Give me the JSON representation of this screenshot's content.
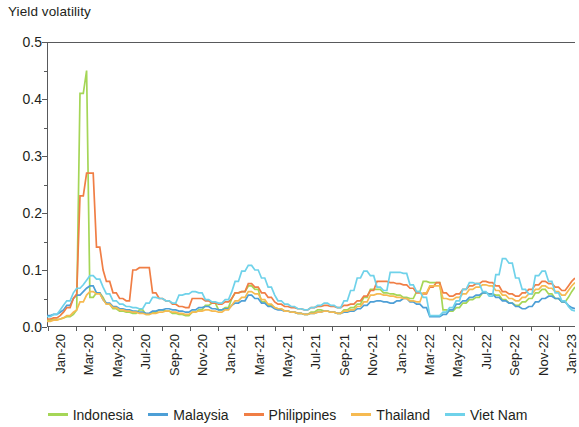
{
  "chart_data": {
    "type": "line",
    "title": "Yield volatility",
    "xlabel": "",
    "ylabel": "",
    "ylim": [
      0.0,
      0.5
    ],
    "ytick_labels": [
      "0.0",
      "0.1",
      "0.2",
      "0.3",
      "0.4",
      "0.5"
    ],
    "ytick_values": [
      0.0,
      0.1,
      0.2,
      0.3,
      0.4,
      0.5
    ],
    "yminor_step": 0.05,
    "grid": false,
    "legend_position": "bottom",
    "x_start": "Jan-20",
    "x_end": "Jan-23",
    "x_tick_labels": [
      "Jan-20",
      "Mar-20",
      "May-20",
      "Jul-20",
      "Sep-20",
      "Nov-20",
      "Jan-21",
      "Mar-21",
      "May-21",
      "Jul-21",
      "Sep-21",
      "Nov-21",
      "Jan-22",
      "Mar-22",
      "May-22",
      "Jul-22",
      "Sep-22",
      "Nov-22",
      "Jan-23"
    ],
    "x": [
      "2020-01-01",
      "2020-01-08",
      "2020-01-15",
      "2020-01-22",
      "2020-01-29",
      "2020-02-05",
      "2020-02-12",
      "2020-02-19",
      "2020-02-26",
      "2020-03-04",
      "2020-03-11",
      "2020-03-18",
      "2020-03-25",
      "2020-04-01",
      "2020-04-08",
      "2020-04-15",
      "2020-04-22",
      "2020-04-29",
      "2020-05-06",
      "2020-05-13",
      "2020-05-20",
      "2020-05-27",
      "2020-06-03",
      "2020-06-10",
      "2020-06-17",
      "2020-06-24",
      "2020-07-01",
      "2020-07-08",
      "2020-07-15",
      "2020-07-22",
      "2020-07-29",
      "2020-08-05",
      "2020-08-12",
      "2020-08-19",
      "2020-08-26",
      "2020-09-02",
      "2020-09-09",
      "2020-09-16",
      "2020-09-23",
      "2020-09-30",
      "2020-10-07",
      "2020-10-14",
      "2020-10-21",
      "2020-10-28",
      "2020-11-04",
      "2020-11-11",
      "2020-11-18",
      "2020-11-25",
      "2020-12-02",
      "2020-12-09",
      "2020-12-16",
      "2020-12-23",
      "2020-12-30",
      "2021-01-06",
      "2021-01-13",
      "2021-01-20",
      "2021-01-27",
      "2021-02-03",
      "2021-02-10",
      "2021-02-17",
      "2021-02-24",
      "2021-03-03",
      "2021-03-10",
      "2021-03-17",
      "2021-03-24",
      "2021-03-31",
      "2021-04-07",
      "2021-04-14",
      "2021-04-21",
      "2021-04-28",
      "2021-05-05",
      "2021-05-12",
      "2021-05-19",
      "2021-05-26",
      "2021-06-02",
      "2021-06-09",
      "2021-06-16",
      "2021-06-23",
      "2021-06-30",
      "2021-07-07",
      "2021-07-14",
      "2021-07-21",
      "2021-07-28",
      "2021-08-04",
      "2021-08-11",
      "2021-08-18",
      "2021-08-25",
      "2021-09-01",
      "2021-09-08",
      "2021-09-15",
      "2021-09-22",
      "2021-09-29",
      "2021-10-06",
      "2021-10-13",
      "2021-10-20",
      "2021-10-27",
      "2021-11-03",
      "2021-11-10",
      "2021-11-17",
      "2021-11-24",
      "2021-12-01",
      "2021-12-08",
      "2021-12-15",
      "2021-12-22",
      "2021-12-29",
      "2022-01-05",
      "2022-01-12",
      "2022-01-19",
      "2022-01-26",
      "2022-02-02",
      "2022-02-09",
      "2022-02-16",
      "2022-02-23",
      "2022-03-02",
      "2022-03-09",
      "2022-03-16",
      "2022-03-23",
      "2022-03-30",
      "2022-04-06",
      "2022-04-13",
      "2022-04-20",
      "2022-04-27",
      "2022-05-04",
      "2022-05-11",
      "2022-05-18",
      "2022-05-25",
      "2022-06-01",
      "2022-06-08",
      "2022-06-15",
      "2022-06-22",
      "2022-06-29",
      "2022-07-06",
      "2022-07-13",
      "2022-07-20",
      "2022-07-27",
      "2022-08-03",
      "2022-08-10",
      "2022-08-17",
      "2022-08-24",
      "2022-08-31",
      "2022-09-07",
      "2022-09-14",
      "2022-09-21",
      "2022-09-28",
      "2022-10-05",
      "2022-10-12",
      "2022-10-19",
      "2022-10-26",
      "2022-11-02",
      "2022-11-09",
      "2022-11-16",
      "2022-11-23",
      "2022-11-30",
      "2022-12-07",
      "2022-12-14",
      "2022-12-21",
      "2022-12-28",
      "2023-01-04",
      "2023-01-11",
      "2023-01-18",
      "2023-01-25"
    ],
    "series": [
      {
        "name": "Indonesia",
        "color": "#a5d657",
        "values": [
          0.012,
          0.012,
          0.013,
          0.013,
          0.014,
          0.016,
          0.018,
          0.018,
          0.022,
          0.03,
          0.41,
          0.41,
          0.45,
          0.052,
          0.052,
          0.06,
          0.06,
          0.052,
          0.04,
          0.04,
          0.032,
          0.032,
          0.028,
          0.028,
          0.026,
          0.026,
          0.024,
          0.024,
          0.03,
          0.03,
          0.022,
          0.022,
          0.026,
          0.026,
          0.03,
          0.03,
          0.028,
          0.028,
          0.024,
          0.024,
          0.022,
          0.022,
          0.02,
          0.02,
          0.026,
          0.026,
          0.03,
          0.03,
          0.038,
          0.038,
          0.042,
          0.042,
          0.03,
          0.03,
          0.034,
          0.034,
          0.05,
          0.06,
          0.06,
          0.062,
          0.062,
          0.072,
          0.072,
          0.066,
          0.066,
          0.044,
          0.044,
          0.038,
          0.038,
          0.034,
          0.032,
          0.032,
          0.028,
          0.028,
          0.026,
          0.026,
          0.024,
          0.024,
          0.022,
          0.022,
          0.026,
          0.026,
          0.03,
          0.03,
          0.028,
          0.028,
          0.026,
          0.026,
          0.024,
          0.024,
          0.03,
          0.03,
          0.034,
          0.034,
          0.04,
          0.04,
          0.052,
          0.052,
          0.066,
          0.066,
          0.066,
          0.066,
          0.06,
          0.06,
          0.058,
          0.058,
          0.056,
          0.056,
          0.052,
          0.052,
          0.05,
          0.05,
          0.062,
          0.062,
          0.08,
          0.08,
          0.078,
          0.078,
          0.078,
          0.078,
          0.03,
          0.03,
          0.028,
          0.028,
          0.034,
          0.034,
          0.042,
          0.042,
          0.048,
          0.048,
          0.052,
          0.052,
          0.06,
          0.06,
          0.058,
          0.058,
          0.056,
          0.056,
          0.048,
          0.048,
          0.042,
          0.042,
          0.038,
          0.038,
          0.044,
          0.044,
          0.05,
          0.05,
          0.06,
          0.06,
          0.066,
          0.066,
          0.058,
          0.058,
          0.05,
          0.05,
          0.044,
          0.044,
          0.052,
          0.062,
          0.07
        ]
      },
      {
        "name": "Malaysia",
        "color": "#4d9fd6",
        "values": [
          0.02,
          0.02,
          0.022,
          0.022,
          0.026,
          0.03,
          0.038,
          0.038,
          0.05,
          0.056,
          0.056,
          0.062,
          0.068,
          0.072,
          0.072,
          0.06,
          0.06,
          0.048,
          0.042,
          0.042,
          0.036,
          0.036,
          0.032,
          0.032,
          0.03,
          0.03,
          0.028,
          0.028,
          0.026,
          0.026,
          0.024,
          0.024,
          0.028,
          0.028,
          0.03,
          0.03,
          0.032,
          0.032,
          0.03,
          0.03,
          0.028,
          0.028,
          0.026,
          0.026,
          0.03,
          0.03,
          0.034,
          0.034,
          0.036,
          0.036,
          0.032,
          0.032,
          0.03,
          0.03,
          0.032,
          0.032,
          0.038,
          0.042,
          0.042,
          0.046,
          0.046,
          0.056,
          0.056,
          0.05,
          0.05,
          0.042,
          0.042,
          0.036,
          0.036,
          0.032,
          0.03,
          0.03,
          0.028,
          0.028,
          0.026,
          0.026,
          0.024,
          0.024,
          0.022,
          0.022,
          0.024,
          0.024,
          0.026,
          0.026,
          0.028,
          0.028,
          0.026,
          0.026,
          0.024,
          0.024,
          0.026,
          0.026,
          0.028,
          0.028,
          0.032,
          0.032,
          0.038,
          0.038,
          0.044,
          0.044,
          0.046,
          0.046,
          0.044,
          0.044,
          0.042,
          0.042,
          0.046,
          0.046,
          0.05,
          0.05,
          0.044,
          0.044,
          0.04,
          0.04,
          0.034,
          0.034,
          0.018,
          0.018,
          0.018,
          0.018,
          0.022,
          0.022,
          0.03,
          0.03,
          0.04,
          0.04,
          0.046,
          0.046,
          0.052,
          0.052,
          0.056,
          0.056,
          0.06,
          0.06,
          0.058,
          0.058,
          0.052,
          0.052,
          0.046,
          0.046,
          0.042,
          0.042,
          0.036,
          0.036,
          0.032,
          0.032,
          0.036,
          0.036,
          0.044,
          0.044,
          0.05,
          0.05,
          0.054,
          0.054,
          0.05,
          0.05,
          0.044,
          0.044,
          0.038,
          0.034,
          0.032
        ]
      },
      {
        "name": "Philippines",
        "color": "#f07e45",
        "values": [
          0.014,
          0.014,
          0.016,
          0.016,
          0.02,
          0.026,
          0.034,
          0.034,
          0.05,
          0.058,
          0.23,
          0.23,
          0.27,
          0.27,
          0.27,
          0.14,
          0.14,
          0.1,
          0.08,
          0.08,
          0.06,
          0.06,
          0.05,
          0.05,
          0.046,
          0.046,
          0.1,
          0.1,
          0.104,
          0.104,
          0.104,
          0.104,
          0.06,
          0.06,
          0.05,
          0.05,
          0.046,
          0.046,
          0.04,
          0.04,
          0.036,
          0.036,
          0.034,
          0.034,
          0.05,
          0.05,
          0.05,
          0.05,
          0.046,
          0.046,
          0.042,
          0.042,
          0.04,
          0.04,
          0.044,
          0.044,
          0.05,
          0.06,
          0.06,
          0.062,
          0.062,
          0.076,
          0.076,
          0.07,
          0.07,
          0.06,
          0.06,
          0.052,
          0.052,
          0.044,
          0.04,
          0.04,
          0.036,
          0.036,
          0.034,
          0.034,
          0.032,
          0.032,
          0.03,
          0.03,
          0.034,
          0.034,
          0.036,
          0.036,
          0.038,
          0.038,
          0.036,
          0.036,
          0.034,
          0.034,
          0.038,
          0.038,
          0.04,
          0.04,
          0.046,
          0.046,
          0.054,
          0.054,
          0.064,
          0.064,
          0.08,
          0.08,
          0.08,
          0.08,
          0.078,
          0.078,
          0.076,
          0.076,
          0.074,
          0.074,
          0.068,
          0.068,
          0.06,
          0.06,
          0.058,
          0.058,
          0.07,
          0.07,
          0.078,
          0.078,
          0.06,
          0.06,
          0.054,
          0.054,
          0.058,
          0.058,
          0.066,
          0.066,
          0.072,
          0.072,
          0.076,
          0.076,
          0.08,
          0.08,
          0.078,
          0.078,
          0.072,
          0.072,
          0.062,
          0.062,
          0.058,
          0.058,
          0.054,
          0.054,
          0.06,
          0.06,
          0.066,
          0.066,
          0.074,
          0.074,
          0.08,
          0.08,
          0.076,
          0.076,
          0.07,
          0.07,
          0.064,
          0.064,
          0.072,
          0.08,
          0.086
        ]
      },
      {
        "name": "Thailand",
        "color": "#f6ba51",
        "values": [
          0.01,
          0.01,
          0.012,
          0.012,
          0.014,
          0.016,
          0.02,
          0.02,
          0.026,
          0.03,
          0.044,
          0.044,
          0.056,
          0.062,
          0.062,
          0.058,
          0.058,
          0.048,
          0.04,
          0.04,
          0.034,
          0.034,
          0.03,
          0.03,
          0.028,
          0.028,
          0.026,
          0.026,
          0.024,
          0.024,
          0.022,
          0.022,
          0.024,
          0.024,
          0.026,
          0.026,
          0.028,
          0.028,
          0.026,
          0.026,
          0.024,
          0.024,
          0.022,
          0.022,
          0.026,
          0.026,
          0.028,
          0.028,
          0.03,
          0.03,
          0.028,
          0.028,
          0.026,
          0.026,
          0.03,
          0.03,
          0.038,
          0.046,
          0.046,
          0.052,
          0.052,
          0.062,
          0.062,
          0.058,
          0.058,
          0.048,
          0.048,
          0.04,
          0.04,
          0.034,
          0.032,
          0.032,
          0.028,
          0.028,
          0.026,
          0.026,
          0.024,
          0.024,
          0.022,
          0.022,
          0.024,
          0.024,
          0.026,
          0.026,
          0.028,
          0.028,
          0.026,
          0.026,
          0.024,
          0.024,
          0.028,
          0.028,
          0.03,
          0.03,
          0.036,
          0.036,
          0.044,
          0.044,
          0.056,
          0.056,
          0.058,
          0.058,
          0.056,
          0.056,
          0.054,
          0.054,
          0.052,
          0.052,
          0.05,
          0.05,
          0.046,
          0.046,
          0.044,
          0.044,
          0.06,
          0.06,
          0.072,
          0.072,
          0.072,
          0.072,
          0.05,
          0.05,
          0.048,
          0.048,
          0.052,
          0.052,
          0.058,
          0.058,
          0.066,
          0.066,
          0.07,
          0.07,
          0.074,
          0.074,
          0.072,
          0.072,
          0.064,
          0.064,
          0.056,
          0.056,
          0.05,
          0.05,
          0.046,
          0.046,
          0.052,
          0.052,
          0.058,
          0.058,
          0.066,
          0.066,
          0.072,
          0.072,
          0.068,
          0.068,
          0.062,
          0.062,
          0.056,
          0.056,
          0.064,
          0.072,
          0.078
        ]
      },
      {
        "name": "Viet Nam",
        "color": "#6fd2ea",
        "values": [
          0.018,
          0.018,
          0.022,
          0.022,
          0.03,
          0.038,
          0.046,
          0.046,
          0.06,
          0.068,
          0.068,
          0.074,
          0.082,
          0.09,
          0.09,
          0.084,
          0.084,
          0.07,
          0.058,
          0.058,
          0.046,
          0.046,
          0.04,
          0.04,
          0.036,
          0.036,
          0.034,
          0.034,
          0.032,
          0.032,
          0.042,
          0.042,
          0.052,
          0.052,
          0.05,
          0.05,
          0.046,
          0.046,
          0.042,
          0.042,
          0.056,
          0.056,
          0.058,
          0.058,
          0.062,
          0.062,
          0.06,
          0.06,
          0.048,
          0.048,
          0.044,
          0.044,
          0.042,
          0.042,
          0.048,
          0.048,
          0.062,
          0.08,
          0.08,
          0.098,
          0.098,
          0.108,
          0.108,
          0.1,
          0.1,
          0.086,
          0.086,
          0.07,
          0.07,
          0.056,
          0.046,
          0.046,
          0.04,
          0.04,
          0.036,
          0.036,
          0.032,
          0.032,
          0.03,
          0.03,
          0.034,
          0.034,
          0.038,
          0.038,
          0.042,
          0.042,
          0.038,
          0.038,
          0.034,
          0.034,
          0.046,
          0.046,
          0.064,
          0.064,
          0.086,
          0.086,
          0.098,
          0.098,
          0.09,
          0.09,
          0.07,
          0.07,
          0.064,
          0.064,
          0.096,
          0.096,
          0.096,
          0.096,
          0.094,
          0.094,
          0.074,
          0.074,
          0.062,
          0.062,
          0.052,
          0.052,
          0.02,
          0.02,
          0.02,
          0.02,
          0.026,
          0.026,
          0.034,
          0.034,
          0.046,
          0.046,
          0.066,
          0.066,
          0.078,
          0.078,
          0.076,
          0.076,
          0.062,
          0.062,
          0.054,
          0.054,
          0.092,
          0.092,
          0.12,
          0.12,
          0.112,
          0.112,
          0.086,
          0.086,
          0.066,
          0.066,
          0.058,
          0.058,
          0.09,
          0.09,
          0.098,
          0.098,
          0.08,
          0.08,
          0.06,
          0.06,
          0.046,
          0.046,
          0.036,
          0.03,
          0.028
        ]
      }
    ]
  },
  "legend": {
    "items": [
      {
        "label": "Indonesia",
        "color": "#a5d657"
      },
      {
        "label": "Malaysia",
        "color": "#4d9fd6"
      },
      {
        "label": "Philippines",
        "color": "#f07e45"
      },
      {
        "label": "Thailand",
        "color": "#f6ba51"
      },
      {
        "label": "Viet Nam",
        "color": "#6fd2ea"
      }
    ]
  }
}
